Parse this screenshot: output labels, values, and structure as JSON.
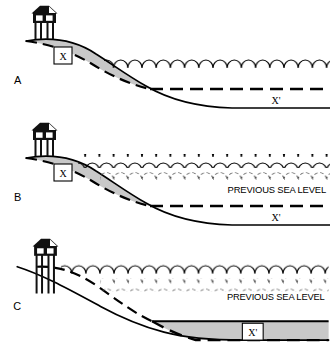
{
  "figure": {
    "width": 330,
    "height": 353,
    "background_color": "#ffffff"
  },
  "colors": {
    "sediment_fill": "#c8c8c8",
    "line": "#000000",
    "label_box_fill": "#ffffff",
    "roof_fill": "#1a1a1a",
    "wave_line": "#000000",
    "previous_wave_line": "#555555"
  },
  "panels": [
    {
      "id": "A",
      "label": "A",
      "beach_label": "X",
      "offshore_label": "X'",
      "has_previous_sea_level": false,
      "previous_sea_level_text": "",
      "house_on_stilts": true,
      "stilts_exposed": false,
      "description": "Original shoreline with beach sediment wedge X and house on low stilts"
    },
    {
      "id": "B",
      "label": "B",
      "beach_label": "X",
      "offshore_label": "X'",
      "has_previous_sea_level": true,
      "previous_sea_level_text": "PREVIOUS SEA LEVEL",
      "house_on_stilts": true,
      "stilts_exposed": false,
      "description": "Sea level has risen above previous sea level; beach wedge X narrows"
    },
    {
      "id": "C",
      "label": "C",
      "beach_label": "",
      "offshore_label": "X'",
      "has_previous_sea_level": true,
      "previous_sea_level_text": "PREVIOUS SEA LEVEL",
      "house_on_stilts": true,
      "stilts_exposed": true,
      "description": "Beach eroded away, house stands on exposed stilts, sediment deposited offshore as X'"
    }
  ]
}
